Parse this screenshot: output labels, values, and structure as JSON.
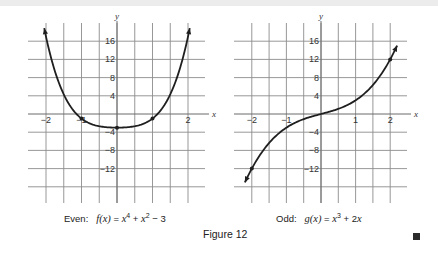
{
  "figure": {
    "label": "Figure 12",
    "end_mark": "■"
  },
  "chart_data": [
    {
      "type": "line",
      "title": "Even: f(x) = x^4 + x^2 - 3",
      "caption_prefix": "Even:",
      "caption_func": "f(x)",
      "caption_expr": [
        {
          "t": "x",
          "sup": "4"
        },
        {
          "t": " + "
        },
        {
          "t": "x",
          "sup": "2"
        },
        {
          "t": " − 3"
        }
      ],
      "xlabel": "x",
      "ylabel": "y",
      "xlim": [
        -2.5,
        2.5
      ],
      "ylim": [
        -20,
        20
      ],
      "grid": true,
      "x_ticks": [
        -2,
        -1,
        2
      ],
      "x_tick_labels": [
        "−2",
        "−1",
        "2"
      ],
      "y_ticks": [
        16,
        12,
        8,
        4,
        -4,
        -8,
        -12
      ],
      "y_tick_labels": [
        "16",
        "12",
        "8",
        "4",
        "−4",
        "−8",
        "−12"
      ],
      "function": "x^4 + x^2 - 3",
      "x_range": [
        -2.05,
        2.05
      ],
      "arrows_at_ends": true,
      "marked_points": [
        {
          "x": -1,
          "y": -1
        },
        {
          "x": 0,
          "y": -3
        },
        {
          "x": 1,
          "y": -1
        }
      ],
      "sample_points": [
        {
          "x": -2,
          "y": 17
        },
        {
          "x": -1.5,
          "y": 4.3125
        },
        {
          "x": -1,
          "y": -1
        },
        {
          "x": -0.5,
          "y": -2.6875
        },
        {
          "x": 0,
          "y": -3
        },
        {
          "x": 0.5,
          "y": -2.6875
        },
        {
          "x": 1,
          "y": -1
        },
        {
          "x": 1.5,
          "y": 4.3125
        },
        {
          "x": 2,
          "y": 17
        }
      ]
    },
    {
      "type": "line",
      "title": "Odd: g(x) = x^3 + 2x",
      "caption_prefix": "Odd:",
      "caption_func": "g(x)",
      "caption_expr": [
        {
          "t": "x",
          "sup": "3"
        },
        {
          "t": " + 2"
        },
        {
          "t": "x"
        }
      ],
      "xlabel": "x",
      "ylabel": "y",
      "xlim": [
        -2.5,
        2.5
      ],
      "ylim": [
        -20,
        20
      ],
      "grid": true,
      "x_ticks": [
        -2,
        -1,
        1,
        2
      ],
      "x_tick_labels": [
        "−2",
        "−1",
        "1",
        "2"
      ],
      "y_ticks": [
        16,
        12,
        8,
        4,
        -4,
        -8,
        -12
      ],
      "y_tick_labels": [
        "16",
        "12",
        "8",
        "4",
        "−4",
        "−8",
        "−12"
      ],
      "function": "x^3 + 2x",
      "x_range": [
        -2.2,
        2.2
      ],
      "arrows_at_ends": true,
      "marked_points": [
        {
          "x": -2,
          "y": -12
        },
        {
          "x": 2,
          "y": 12
        }
      ],
      "sample_points": [
        {
          "x": -2,
          "y": -12
        },
        {
          "x": -1.5,
          "y": -6.375
        },
        {
          "x": -1,
          "y": -3
        },
        {
          "x": -0.5,
          "y": -1.125
        },
        {
          "x": 0,
          "y": 0
        },
        {
          "x": 0.5,
          "y": 1.125
        },
        {
          "x": 1,
          "y": 3
        },
        {
          "x": 1.5,
          "y": 6.375
        },
        {
          "x": 2,
          "y": 12
        }
      ]
    }
  ]
}
